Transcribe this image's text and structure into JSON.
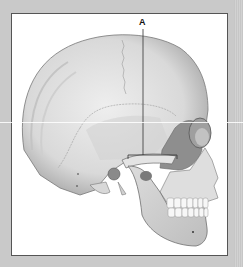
{
  "diagram": {
    "labels": [
      {
        "id": "A",
        "text": "A",
        "target": "zygomatic-arch"
      }
    ]
  },
  "colors": {
    "background": "#c9c9c9",
    "panel": "#ffffff",
    "bone": "#e6e6e6",
    "bone_shadow": "#b5b5b5",
    "highlight_region": "#8e8e8e",
    "leader_line": "#333333"
  }
}
